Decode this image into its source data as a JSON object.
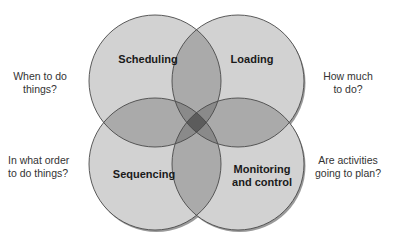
{
  "diagram": {
    "type": "four-circle venn",
    "circles": [
      {
        "id": "scheduling",
        "label": "Scheduling",
        "question": "When to do things?",
        "question_lines": [
          "When to do",
          "things?"
        ]
      },
      {
        "id": "loading",
        "label": "Loading",
        "question": "How much to do?",
        "question_lines": [
          "How much",
          "to do?"
        ]
      },
      {
        "id": "sequencing",
        "label": "Sequencing",
        "question": "In what order to do things?",
        "question_lines": [
          "In what order",
          "to do things?"
        ]
      },
      {
        "id": "monitoring",
        "label": "Monitoring and control",
        "label_lines": [
          "Monitoring",
          "and control"
        ],
        "question": "Are activities going to plan?",
        "question_lines": [
          "Are activities",
          "going to plan?"
        ]
      }
    ],
    "colors": {
      "single": "#d2d2d2",
      "double": "#aaaaaa",
      "triple": "#8a8a8a",
      "quad": "#5c5c5c",
      "outline": "#555555"
    }
  }
}
